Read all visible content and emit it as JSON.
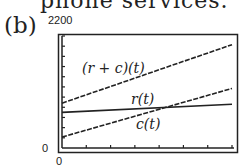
{
  "header": {
    "caption_fragment": "phone services.",
    "part_label": "(b)"
  },
  "axes": {
    "y_max_label": "2200",
    "y_min_label": "0",
    "x_min_label": "0"
  },
  "labels": {
    "sum": "(r + c)(t)",
    "r": "r(t)",
    "c": "c(t)"
  },
  "colors": {
    "line": "#222222",
    "frame": "#222222",
    "background": "#ffffff"
  },
  "chart_data": {
    "type": "line",
    "title": "",
    "xlabel": "t",
    "ylabel": "",
    "xlim": [
      0,
      7
    ],
    "ylim": [
      0,
      2200
    ],
    "x_ticks": 7,
    "y_ticks": 11,
    "grid": false,
    "x": [
      0,
      7
    ],
    "series": [
      {
        "name": "(r + c)(t)",
        "values": [
          880,
          2030
        ],
        "style": "dashed"
      },
      {
        "name": "r(t)",
        "values": [
          700,
          860
        ],
        "style": "solid-steps"
      },
      {
        "name": "c(t)",
        "values": [
          215,
          1170
        ],
        "style": "dashed"
      }
    ],
    "annotations": [
      "(r + c)(t)",
      "r(t)",
      "c(t)"
    ]
  }
}
